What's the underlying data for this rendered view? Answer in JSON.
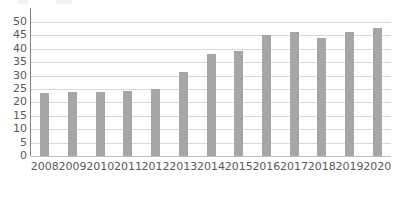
{
  "chart_data": {
    "type": "bar",
    "title": "",
    "subtitle": "",
    "xlabel": "",
    "ylabel": "",
    "categories": [
      "2008",
      "2009",
      "2010",
      "2011",
      "2012",
      "2013",
      "2014",
      "2015",
      "2016",
      "2017",
      "2018",
      "2019",
      "2020"
    ],
    "values": [
      23.6,
      24.0,
      24.0,
      24.2,
      25.0,
      31.4,
      38.0,
      39.3,
      45.0,
      46.3,
      44.0,
      46.3,
      47.6
    ],
    "series": [
      {
        "name": "",
        "values": [
          23.6,
          24.0,
          24.0,
          24.2,
          25.0,
          31.4,
          38.0,
          39.3,
          45.0,
          46.3,
          44.0,
          46.3,
          47.6
        ]
      }
    ],
    "ylim": [
      0,
      50
    ],
    "yticks": [
      0,
      5,
      10,
      15,
      20,
      25,
      30,
      35,
      40,
      45,
      50
    ],
    "ytick_labels": [
      "0",
      "5",
      "10",
      "15",
      "20",
      "25",
      "30",
      "35",
      "40",
      "45",
      "50"
    ],
    "grid": true,
    "grid_axis": "y",
    "legend": false,
    "legend_position": "none",
    "bar_color": "#a6a6a6",
    "gridline_color": "#d9d9d9",
    "axis_color": "#808080",
    "text_color": "#595959",
    "background_color": "#ffffff",
    "annotations": []
  }
}
